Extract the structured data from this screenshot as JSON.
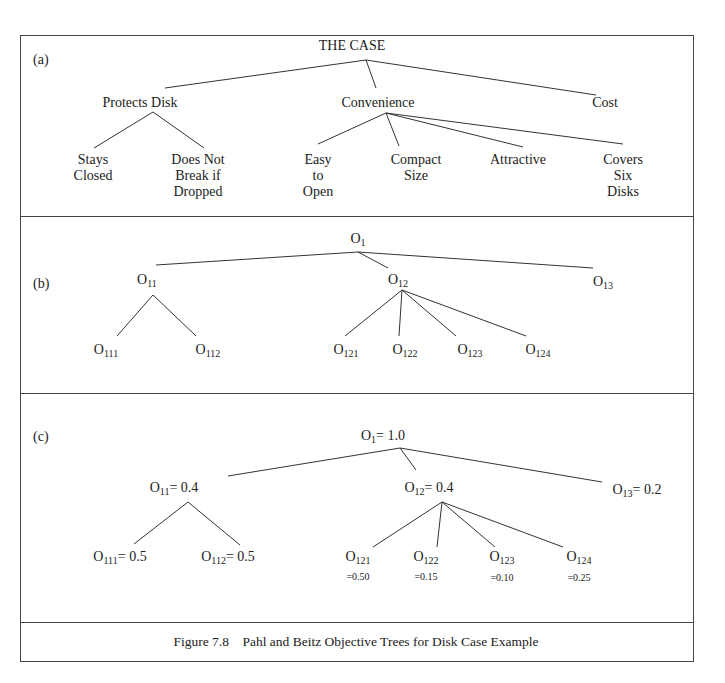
{
  "figure": {
    "caption": "Figure 7.8    Pahl and Beitz Objective Trees for Disk Case Example"
  },
  "panel_a": {
    "label": "(a)",
    "root": "THE CASE",
    "level1": [
      "Protects Disk",
      "Convenience",
      "Cost"
    ],
    "leaves": [
      [
        "Stays",
        "Closed"
      ],
      [
        "Does Not",
        "Break if",
        "Dropped"
      ],
      [
        "Easy",
        "to",
        "Open"
      ],
      [
        "Compact",
        "Size"
      ],
      [
        "Attractive"
      ],
      [
        "Covers",
        "Six",
        "Disks"
      ]
    ]
  },
  "panel_b": {
    "label": "(b)",
    "root": {
      "base": "O",
      "sub": "1"
    },
    "level1": [
      {
        "base": "O",
        "sub": "11"
      },
      {
        "base": "O",
        "sub": "12"
      },
      {
        "base": "O",
        "sub": "13"
      }
    ],
    "leaves": [
      {
        "base": "O",
        "sub": "111"
      },
      {
        "base": "O",
        "sub": "112"
      },
      {
        "base": "O",
        "sub": "121"
      },
      {
        "base": "O",
        "sub": "122"
      },
      {
        "base": "O",
        "sub": "123"
      },
      {
        "base": "O",
        "sub": "124"
      }
    ]
  },
  "panel_c": {
    "label": "(c)",
    "root": {
      "base": "O",
      "sub": "1",
      "value": "= 1.0"
    },
    "level1": [
      {
        "base": "O",
        "sub": "11",
        "value": "= 0.4"
      },
      {
        "base": "O",
        "sub": "12",
        "value": "= 0.4"
      },
      {
        "base": "O",
        "sub": "13",
        "value": "= 0.2"
      }
    ],
    "leaves": [
      {
        "base": "O",
        "sub": "111",
        "value": "= 0.5"
      },
      {
        "base": "O",
        "sub": "112",
        "value": "= 0.5"
      },
      {
        "base": "O",
        "sub": "121",
        "value": "=0.50"
      },
      {
        "base": "O",
        "sub": "122",
        "value": "=0.15"
      },
      {
        "base": "O",
        "sub": "123",
        "value": "=0.10"
      },
      {
        "base": "O",
        "sub": "124",
        "value": "=0.25"
      }
    ]
  }
}
